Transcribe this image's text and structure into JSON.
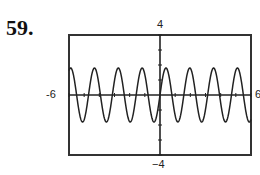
{
  "problem": {
    "number": "59."
  },
  "window": {
    "xmin_label": "-6",
    "xmax_label": "6",
    "ymax_label": "4",
    "ymin_label": "−4"
  },
  "chart_data": {
    "type": "line",
    "title": "",
    "xlabel": "",
    "ylabel": "",
    "xlim": [
      -6,
      6
    ],
    "ylim": [
      -4,
      4
    ],
    "x_ticks": 1,
    "y_ticks": 1,
    "grid": false,
    "series": [
      {
        "name": "y ≈ 1.8 sin(4x)",
        "amplitude": 1.8,
        "angular_frequency": 4,
        "x_range": [
          -6,
          6
        ]
      }
    ],
    "colors": {
      "curve": "#222222",
      "frame": "#333333",
      "axes": "#222222"
    }
  }
}
